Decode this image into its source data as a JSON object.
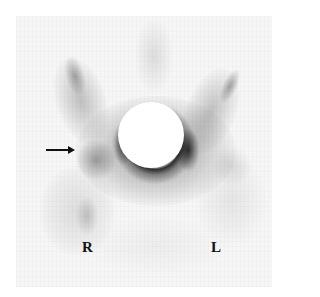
{
  "figure": {
    "type": "bone scintigraphy (pelvis, posterior-like view)",
    "labels": {
      "right": "R",
      "left": "L"
    },
    "annotations": [
      {
        "type": "arrow",
        "direction": "right",
        "target": "right hip / femoral head region"
      }
    ],
    "colors": {
      "background": "#ffffff",
      "scan_background": "#f6f6f6",
      "uptake": "#000000",
      "annotation": "#111111"
    }
  }
}
